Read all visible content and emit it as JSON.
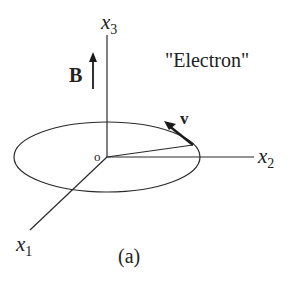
{
  "figure": {
    "caption": "(a)",
    "title_label": "\"Electron\"",
    "field_label": "B",
    "velocity_label": "v",
    "origin_label": "O",
    "axes": {
      "x1": {
        "base": "x",
        "sub": "1"
      },
      "x2": {
        "base": "x",
        "sub": "2"
      },
      "x3": {
        "base": "x",
        "sub": "3"
      }
    },
    "colors": {
      "stroke": "#2a2a2a",
      "text": "#222222",
      "background": "#ffffff"
    }
  }
}
